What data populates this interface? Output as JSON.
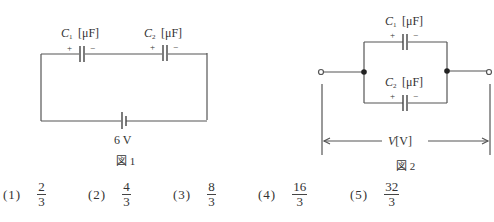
{
  "figure1": {
    "caption": "図 1",
    "c1_label": "C",
    "c1_sub": "1",
    "c2_label": "C",
    "c2_sub": "2",
    "unit": "[μF]",
    "plus": "+",
    "minus": "−",
    "battery_label": "6 V"
  },
  "figure2": {
    "caption": "図 2",
    "c1_label": "C",
    "c1_sub": "1",
    "c2_label": "C",
    "c2_sub": "2",
    "unit": "[μF]",
    "plus": "+",
    "minus": "−",
    "voltage_label": "V",
    "voltage_unit": "[V]"
  },
  "choices": [
    {
      "num": "(1)",
      "numerator": "2",
      "denominator": "3"
    },
    {
      "num": "(2)",
      "numerator": "4",
      "denominator": "3"
    },
    {
      "num": "(3)",
      "numerator": "8",
      "denominator": "3"
    },
    {
      "num": "(4)",
      "numerator": "16",
      "denominator": "3"
    },
    {
      "num": "(5)",
      "numerator": "32",
      "denominator": "3"
    }
  ]
}
